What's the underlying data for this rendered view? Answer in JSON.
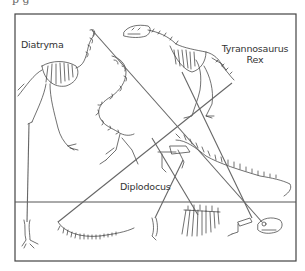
{
  "page": {
    "cropped_header_text": "p g"
  },
  "diagram": {
    "frame": {
      "x": 15,
      "y": 14,
      "width": 281,
      "height": 247,
      "stroke": "#444444"
    },
    "divider": {
      "y": 202,
      "stroke": "#555555"
    },
    "labels": {
      "diatryma": "Diatryma",
      "trex_line1": "Tyrannosaurus",
      "trex_line2": "Rex",
      "diplodocus": "Diplodocus"
    },
    "figures": [
      {
        "name": "Diatryma skeleton",
        "region": "top-left"
      },
      {
        "name": "Diplodocus neck",
        "region": "center"
      },
      {
        "name": "Tyrannosaurus Rex skeleton",
        "region": "top-right"
      },
      {
        "name": "Diplodocus body and tail",
        "region": "middle-right"
      }
    ],
    "loose_bones": [
      {
        "name": "Diatryma foot",
        "x": 27
      },
      {
        "name": "Diplodocus tail",
        "x": 95
      },
      {
        "name": "leg bone",
        "x": 155
      },
      {
        "name": "rib cage",
        "x": 200
      },
      {
        "name": "arm bone",
        "x": 240
      },
      {
        "name": "skull",
        "x": 270
      }
    ],
    "connector_color": "#666666"
  }
}
